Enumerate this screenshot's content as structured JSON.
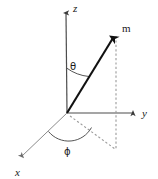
{
  "figure": {
    "background_color": "#ffffff",
    "width": 158,
    "height": 179
  },
  "colors": {
    "axis_z": "#4d4d4d",
    "axis_y": "#4d4d4d",
    "axis_x": "#8c8c8c",
    "vector": "#111111",
    "dashed": "#999999",
    "arc": "#555555",
    "text": "#1a1a1a"
  },
  "axes": {
    "z": {
      "label": "z",
      "origin": [
        67,
        113
      ],
      "tip": [
        66,
        9
      ],
      "label_pos": [
        73,
        12
      ]
    },
    "y": {
      "label": "y",
      "origin": [
        67,
        113
      ],
      "tip": [
        138,
        113
      ],
      "label_pos": [
        143,
        117
      ]
    },
    "x": {
      "label": "x",
      "origin": [
        67,
        113
      ],
      "tip": [
        18,
        160
      ],
      "label_pos": [
        16,
        175
      ]
    }
  },
  "vector": {
    "label": "m",
    "origin": [
      67,
      113
    ],
    "tip": [
      116,
      33
    ],
    "label_pos": [
      123,
      31
    ],
    "description": "magnetic moment vector"
  },
  "projection": {
    "vertical_dashed": {
      "from": [
        116,
        33
      ],
      "to": [
        116,
        149
      ]
    },
    "ground_dashed": {
      "from": [
        67,
        113
      ],
      "to": [
        116,
        149
      ]
    }
  },
  "angles": {
    "theta": {
      "label": "θ",
      "label_pos": [
        72,
        67
      ],
      "description": "polar angle from z-axis to vector"
    },
    "phi": {
      "label": "ϕ",
      "label_pos": [
        67,
        151
      ],
      "description": "azimuthal angle from x-axis to projection"
    }
  }
}
